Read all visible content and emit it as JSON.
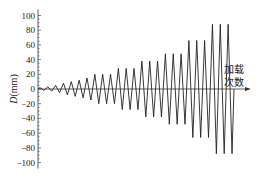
{
  "chart_data": {
    "type": "line",
    "title": "",
    "xlabel": "加载次数",
    "xlabel_lines": [
      "加载",
      "次数"
    ],
    "ylabel": "D(mm)",
    "ylabel_italic": "D",
    "ylabel_unit": "(mm)",
    "ylim": [
      -100,
      100
    ],
    "yticks": [
      100,
      80,
      60,
      40,
      20,
      0,
      -20,
      -40,
      -60,
      -80,
      -100
    ],
    "ytick_labels": [
      "100",
      "80",
      "60",
      "40",
      "20",
      "0",
      "−20",
      "−40",
      "−60",
      "−80",
      "−100"
    ],
    "grid": false,
    "legend": null,
    "cycle_amplitudes": [
      2,
      3,
      5,
      8,
      10,
      12,
      15,
      20,
      20,
      20,
      28,
      28,
      28,
      38,
      38,
      38,
      48,
      48,
      48,
      66,
      66,
      66,
      88,
      88,
      88
    ],
    "series": [
      {
        "name": "D",
        "peaks": [
          2,
          3,
          5,
          8,
          10,
          12,
          15,
          20,
          20,
          20,
          28,
          28,
          28,
          38,
          38,
          38,
          48,
          48,
          48,
          66,
          66,
          66,
          88,
          88,
          88
        ],
        "troughs": [
          -2,
          -3,
          -5,
          -8,
          -10,
          -12,
          -15,
          -20,
          -20,
          -20,
          -28,
          -28,
          -28,
          -38,
          -38,
          -38,
          -48,
          -48,
          -48,
          -66,
          -66,
          -66,
          -88,
          -88,
          -88
        ]
      }
    ]
  },
  "colors": {
    "line": "#222222",
    "axis": "#333333",
    "background": "#ffffff"
  }
}
